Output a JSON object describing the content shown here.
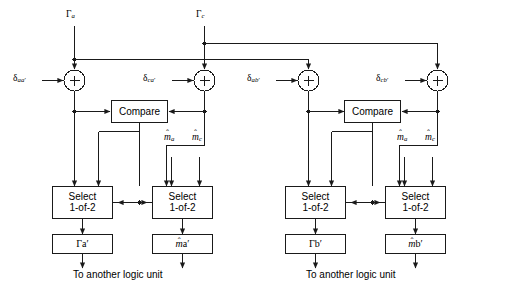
{
  "diagram": {
    "type": "block-diagram",
    "caption_left": "To another logic unit",
    "caption_right": "To another logic unit",
    "colors": {
      "line": "#1a1a1a",
      "background": "#ffffff",
      "text": "#000000"
    },
    "units": [
      {
        "id": "left-unit",
        "inputs_top": [
          {
            "name": "gamma-a",
            "glyph": "Γ",
            "sub": "a",
            "prime": false
          },
          {
            "name": "gamma-c",
            "glyph": "Γ",
            "sub": "c",
            "prime": false
          }
        ],
        "adders": [
          {
            "name": "adder-aa-prime",
            "symbol": "+",
            "input_label_glyph": "δ",
            "input_label_sub": "aa",
            "input_label_prime": true
          },
          {
            "name": "adder-ca-prime",
            "symbol": "+",
            "input_label_glyph": "δ",
            "input_label_sub": "ca",
            "input_label_prime": true
          }
        ],
        "compare": {
          "name": "compare-block",
          "label": "Compare"
        },
        "selects": [
          {
            "name": "select-gamma",
            "line1": "Select",
            "line2": "1-of-2"
          },
          {
            "name": "select-m",
            "line1": "Select",
            "line2": "1-of-2"
          }
        ],
        "m_inputs": [
          {
            "name": "m-hat-a",
            "glyph": "m",
            "hat": true,
            "sub": "a",
            "prime": false
          },
          {
            "name": "m-hat-c",
            "glyph": "m",
            "hat": true,
            "sub": "c",
            "prime": false
          }
        ],
        "outputs": [
          {
            "name": "output-gamma-a-prime",
            "glyph": "Γ",
            "hat": false,
            "sub": "a",
            "prime": true
          },
          {
            "name": "output-m-hat-a-prime",
            "glyph": "m",
            "hat": true,
            "sub": "a",
            "prime": true
          }
        ]
      },
      {
        "id": "right-unit",
        "adders": [
          {
            "name": "adder-ab-prime",
            "symbol": "+",
            "input_label_glyph": "δ",
            "input_label_sub": "ab",
            "input_label_prime": true
          },
          {
            "name": "adder-cb-prime",
            "symbol": "+",
            "input_label_glyph": "δ",
            "input_label_sub": "cb",
            "input_label_prime": true
          }
        ],
        "compare": {
          "name": "compare-block",
          "label": "Compare"
        },
        "selects": [
          {
            "name": "select-gamma",
            "line1": "Select",
            "line2": "1-of-2"
          },
          {
            "name": "select-m",
            "line1": "Select",
            "line2": "1-of-2"
          }
        ],
        "m_inputs": [
          {
            "name": "m-hat-a",
            "glyph": "m",
            "hat": true,
            "sub": "a",
            "prime": false
          },
          {
            "name": "m-hat-c",
            "glyph": "m",
            "hat": true,
            "sub": "c",
            "prime": false
          }
        ],
        "outputs": [
          {
            "name": "output-gamma-b-prime",
            "glyph": "Γ",
            "hat": false,
            "sub": "b",
            "prime": true
          },
          {
            "name": "output-m-hat-b-prime",
            "glyph": "m",
            "hat": true,
            "sub": "b",
            "prime": true
          }
        ]
      }
    ]
  }
}
